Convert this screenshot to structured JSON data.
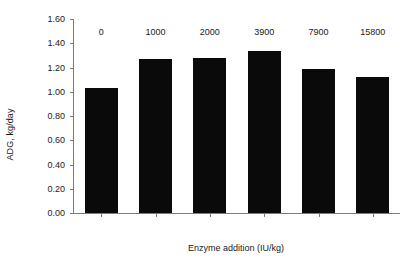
{
  "chart_data": {
    "type": "bar",
    "title": "",
    "subtitle": "",
    "xlabel": "Enzyme addition (IU/kg)",
    "ylabel": "ADG, kg/day",
    "categories": [
      "0",
      "1000",
      "2000",
      "3900",
      "7900",
      "15800"
    ],
    "values": [
      1.03,
      1.27,
      1.28,
      1.34,
      1.19,
      1.12
    ],
    "series": [
      {
        "name": "ADG",
        "values": [
          1.03,
          1.27,
          1.28,
          1.34,
          1.19,
          1.12
        ],
        "color": "#0a0a0a"
      }
    ],
    "ylim": [
      0.0,
      1.6
    ],
    "ytick_step": 0.2,
    "ytick_labels": [
      "0.00",
      "0.20",
      "0.40",
      "0.60",
      "0.80",
      "1.00",
      "1.20",
      "1.40",
      "1.60"
    ],
    "ytick_values": [
      0.0,
      0.2,
      0.4,
      0.6,
      0.8,
      1.0,
      1.2,
      1.4,
      1.6
    ],
    "grid": false,
    "legend": "none",
    "axis_color": "#7b7b7b",
    "bar_color": "#0a0a0a",
    "background": "#ffffff"
  }
}
